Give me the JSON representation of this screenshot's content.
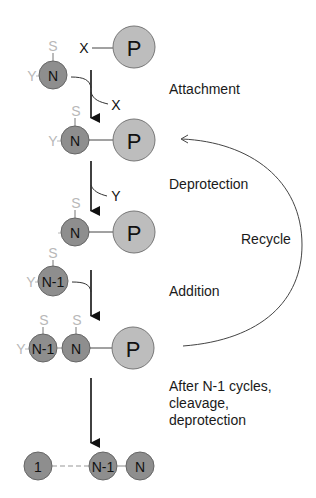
{
  "diagram": {
    "type": "solid-phase synthesis cycle",
    "colors": {
      "residue_fill": "#8e8e8e",
      "resin_fill": "#bdbdbd",
      "protecting_group": "#b8b8b8",
      "line": "#333333",
      "text": "#1a1a1a"
    },
    "symbols": {
      "resin": "P",
      "residue_n": "N",
      "residue_n_minus_1": "N-1",
      "residue_first": "1",
      "side_chain_protect": "S",
      "alpha_protect": "Y",
      "leaving_group": "X"
    },
    "steps": [
      {
        "label": "Attachment"
      },
      {
        "label": "Deprotection"
      },
      {
        "label": "Addition"
      },
      {
        "label": "Recycle"
      }
    ],
    "final_step": {
      "line1": "After N-1 cycles,",
      "line2": "cleavage,",
      "line3": "deprotection"
    },
    "byproducts": {
      "attachment": "X",
      "deprotection": "Y"
    },
    "nodes": [
      {
        "id": "resin-x",
        "label": "P",
        "x": 134,
        "y": 47
      },
      {
        "id": "residue-n-free",
        "label": "N",
        "x": 53,
        "y": 75
      },
      {
        "id": "row2-n",
        "label": "N",
        "x": 75,
        "y": 140
      },
      {
        "id": "row2-p",
        "label": "P",
        "x": 134,
        "y": 140
      },
      {
        "id": "row3-n",
        "label": "N",
        "x": 75,
        "y": 232
      },
      {
        "id": "row3-p",
        "label": "P",
        "x": 134,
        "y": 232
      },
      {
        "id": "residue-n1-free",
        "label": "N-1",
        "x": 53,
        "y": 281
      },
      {
        "id": "row4-n1",
        "label": "N-1",
        "x": 43,
        "y": 348
      },
      {
        "id": "row4-n",
        "label": "N",
        "x": 76,
        "y": 348
      },
      {
        "id": "row4-p",
        "label": "P",
        "x": 133,
        "y": 348
      },
      {
        "id": "final-1",
        "label": "1",
        "x": 38,
        "y": 466
      },
      {
        "id": "final-n1",
        "label": "N-1",
        "x": 103,
        "y": 466
      },
      {
        "id": "final-n",
        "label": "N",
        "x": 140,
        "y": 466
      }
    ]
  }
}
